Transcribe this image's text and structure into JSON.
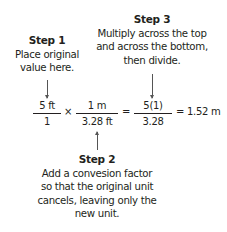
{
  "steps": [
    {
      "title": "Step 1",
      "lines": [
        "Place original",
        "value here."
      ]
    },
    {
      "title": "Step 2",
      "lines": [
        "Add a convesion factor",
        "so that the original unit",
        "cancels, leaving only the",
        "new unit."
      ]
    },
    {
      "title": "Step 3",
      "lines": [
        "Multiply across the top",
        "and across the bottom,",
        "then divide."
      ]
    }
  ],
  "equation": {
    "fractions": [
      {
        "numerator": "5 ft",
        "denominator": "1"
      },
      {
        "numerator": "1 m",
        "denominator": "3.28 ft"
      },
      {
        "numerator": "5(1)",
        "denominator": "3.28"
      }
    ],
    "operators": [
      "×",
      "="
    ],
    "result": "= 1.52 m"
  }
}
